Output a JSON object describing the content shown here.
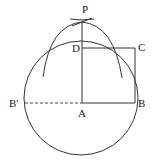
{
  "diagram": {
    "type": "geometric-construction",
    "labels": {
      "P": "P",
      "D": "D",
      "C": "C",
      "B_prime": "B'",
      "A": "A",
      "B": "B"
    },
    "points": {
      "P": [
        82,
        22
      ],
      "D": [
        82,
        48
      ],
      "C": [
        135,
        48
      ],
      "A": [
        82,
        103
      ],
      "B": [
        135,
        103
      ],
      "B_prime": [
        24,
        103
      ]
    },
    "circle": {
      "cx": 81,
      "cy": 98,
      "r": 57
    },
    "colors": {
      "stroke": "#333333",
      "text": "#222222",
      "background": "#ffffff"
    }
  }
}
